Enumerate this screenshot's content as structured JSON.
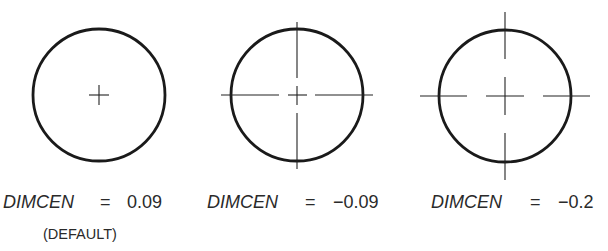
{
  "figures": [
    {
      "id": "fig1",
      "variable": "DIMCEN",
      "equals": "=",
      "value": "0.09",
      "note": "(DEFAULT)",
      "center_style": "center-mark-only",
      "circle": {
        "cx": 99,
        "cy": 95,
        "r": 66
      },
      "mark_half": 10
    },
    {
      "id": "fig2",
      "variable": "DIMCEN",
      "equals": "=",
      "value": "−0.09",
      "note": "",
      "center_style": "center-mark-and-centerlines",
      "circle": {
        "cx": 297,
        "cy": 95,
        "r": 66
      }
    },
    {
      "id": "fig3",
      "variable": "DIMCEN",
      "equals": "=",
      "value": "−0.2",
      "note": "",
      "center_style": "center-mark-and-centerlines",
      "circle": {
        "cx": 505,
        "cy": 96,
        "r": 66
      }
    }
  ],
  "colors": {
    "line": "#1a1a1a",
    "text": "#2a2a2a",
    "background": "#ffffff"
  }
}
